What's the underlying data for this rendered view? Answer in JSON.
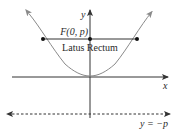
{
  "diagram": {
    "labels": {
      "y_axis": "y",
      "x_axis": "x",
      "focus": "F(0, p)",
      "latus_rectum": "Latus Rectum",
      "directrix": "y = −p"
    },
    "elements": {
      "parabola": {
        "equation": "x^2 = 4py",
        "opens": "up",
        "vertex": "(0, 0)",
        "color": "#8a8a8a"
      },
      "focus_point": {
        "coords": "(0, p)"
      },
      "latus_rectum": {
        "endpoints": [
          "(-2p, p)",
          "(2p, p)"
        ]
      },
      "directrix": {
        "equation": "y = -p",
        "style": "dashed"
      },
      "axes": {
        "color": "#333333"
      }
    },
    "colors": {
      "axis": "#333333",
      "curve": "#8a8a8a",
      "points": "#111111",
      "text": "#2a2a2a"
    }
  }
}
